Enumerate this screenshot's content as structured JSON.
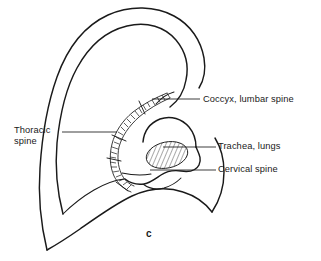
{
  "figure": {
    "caption": "c",
    "background_color": "#ffffff",
    "ink_color": "#1a1a1a"
  },
  "labels": [
    {
      "id": "coccyx",
      "text": "Coccyx, lumbar spine",
      "icon": "leader-line-icon",
      "side": "right"
    },
    {
      "id": "thoracic",
      "text_line_1": "Thoracic",
      "text_line_2": "spine",
      "icon": "leader-line-icon",
      "side": "left"
    },
    {
      "id": "trachea",
      "text": "Trachea, lungs",
      "icon": "leader-line-icon",
      "side": "right"
    },
    {
      "id": "cervical",
      "text": "Cervical spine",
      "icon": "leader-line-icon",
      "side": "right"
    }
  ],
  "regions": {
    "spine_track": "antihelix-vertebral-ladder",
    "hatched_zone": "trachea-lungs-hatched-oval"
  }
}
